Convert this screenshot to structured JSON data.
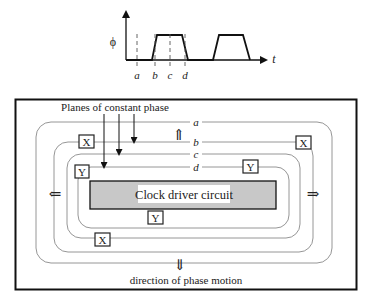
{
  "waveform": {
    "y_label": "ϕ",
    "x_label": "t",
    "time_markers": [
      "a",
      "b",
      "c",
      "d"
    ]
  },
  "clock_diagram": {
    "planes_label": "Planes of constant phase",
    "contours": [
      {
        "id": "a",
        "label": "a"
      },
      {
        "id": "b",
        "label": "b"
      },
      {
        "id": "c",
        "label": "c"
      },
      {
        "id": "d",
        "label": "d"
      }
    ],
    "driver_label": "Clock driver circuit",
    "driver_fill": "#c8c8c8",
    "direction_label": "direction of phase motion",
    "register_labels": {
      "x": "X",
      "y": "Y"
    },
    "arrows": {
      "up": "⇑",
      "down": "⇓",
      "left": "⇐",
      "right": "⇒"
    }
  }
}
